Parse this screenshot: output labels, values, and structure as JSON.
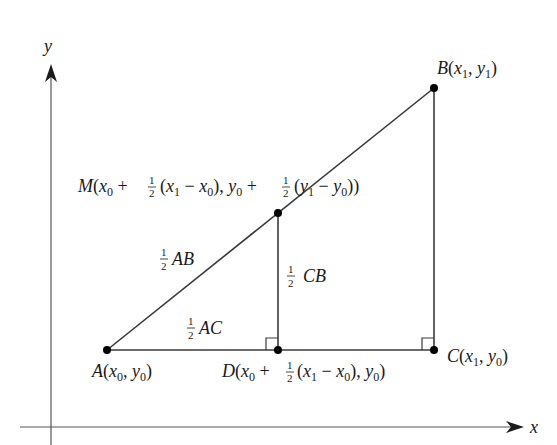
{
  "diagram": {
    "type": "midpoint-geometry",
    "axes": {
      "x_label": "x",
      "y_label": "y"
    },
    "points": {
      "A": {
        "name": "A",
        "coord_x": "x",
        "coord_x_sub": "0",
        "coord_y": "y",
        "coord_y_sub": "0"
      },
      "B": {
        "name": "B",
        "coord_x": "x",
        "coord_x_sub": "1",
        "coord_y": "y",
        "coord_y_sub": "1"
      },
      "C": {
        "name": "C",
        "coord_x": "x",
        "coord_x_sub": "1",
        "coord_y": "y",
        "coord_y_sub": "0"
      },
      "M": {
        "name": "M"
      },
      "D": {
        "name": "D"
      }
    },
    "segment_labels": {
      "half_ab": {
        "frac_num": "1",
        "frac_den": "2",
        "text": "AB"
      },
      "half_ac": {
        "frac_num": "1",
        "frac_den": "2",
        "text": "AC"
      },
      "half_cb": {
        "frac_num": "1",
        "frac_den": "2",
        "text": "CB"
      }
    },
    "strings": {
      "open_paren": "(",
      "close_paren": ")",
      "comma": ", ",
      "plus": " + ",
      "minus": " − ",
      "one": "1",
      "two": "2",
      "x": "x",
      "y": "y",
      "sub0": "0",
      "sub1": "1"
    },
    "colors": {
      "line": "#3a3a3a",
      "axis": "#555555",
      "point": "#000000"
    }
  }
}
